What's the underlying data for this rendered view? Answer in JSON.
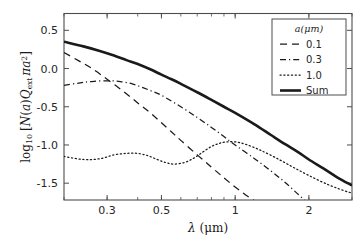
{
  "chart_data": {
    "type": "line",
    "title": "",
    "xlabel": "λ (μm)",
    "ylabel": "log₁₀ [N(a)Q_ext πa²]",
    "xscale": "log",
    "yscale": "linear",
    "xlim": [
      0.2,
      3.0
    ],
    "ylim": [
      -1.72,
      0.72
    ],
    "xticks": [
      0.3,
      0.5,
      1,
      2
    ],
    "xtick_labels": [
      "0.3",
      "0.5",
      "1",
      "2"
    ],
    "yticks": [
      0.5,
      0.0,
      -0.5,
      -1.0,
      -1.5
    ],
    "ytick_labels": [
      "0.5",
      "0.0",
      "-0.5",
      "-1.0",
      "-1.5"
    ],
    "grid": false,
    "legend_position": "upper right",
    "legend_title": "a(μm)",
    "series": [
      {
        "name": "0.1",
        "label": "0.1",
        "style": "dashed",
        "color": "#1a1a1a",
        "x": [
          0.2,
          0.23,
          0.26,
          0.3,
          0.35,
          0.4,
          0.45,
          0.5,
          0.55,
          0.6,
          0.7,
          0.8,
          0.9,
          1.0,
          1.1,
          1.2,
          1.25
        ],
        "y": [
          0.21,
          0.1,
          0.0,
          -0.14,
          -0.3,
          -0.45,
          -0.58,
          -0.71,
          -0.83,
          -0.94,
          -1.13,
          -1.29,
          -1.43,
          -1.55,
          -1.65,
          -1.73,
          -1.78
        ]
      },
      {
        "name": "0.3",
        "label": "0.3",
        "style": "dashdot",
        "color": "#1a1a1a",
        "x": [
          0.2,
          0.23,
          0.26,
          0.3,
          0.34,
          0.38,
          0.42,
          0.46,
          0.5,
          0.6,
          0.7,
          0.8,
          0.9,
          1.0,
          1.2,
          1.4,
          1.6,
          1.8,
          1.95
        ],
        "y": [
          -0.22,
          -0.19,
          -0.17,
          -0.16,
          -0.17,
          -0.2,
          -0.25,
          -0.3,
          -0.35,
          -0.5,
          -0.64,
          -0.77,
          -0.89,
          -1.0,
          -1.18,
          -1.34,
          -1.49,
          -1.64,
          -1.74
        ]
      },
      {
        "name": "1.0",
        "label": "1.0",
        "style": "dotted",
        "color": "#1a1a1a",
        "x": [
          0.2,
          0.24,
          0.28,
          0.32,
          0.36,
          0.4,
          0.44,
          0.48,
          0.52,
          0.56,
          0.62,
          0.68,
          0.74,
          0.8,
          0.86,
          0.92,
          1.0,
          1.1,
          1.25,
          1.45,
          1.7,
          2.0,
          2.4,
          2.8,
          3.0
        ],
        "y": [
          -1.15,
          -1.19,
          -1.18,
          -1.13,
          -1.11,
          -1.11,
          -1.14,
          -1.19,
          -1.23,
          -1.25,
          -1.23,
          -1.17,
          -1.09,
          -1.02,
          -0.98,
          -0.96,
          -0.96,
          -0.99,
          -1.06,
          -1.16,
          -1.28,
          -1.4,
          -1.52,
          -1.6,
          -1.63
        ]
      },
      {
        "name": "Sum",
        "label": "Sum",
        "style": "solid",
        "color": "#1a1a1a",
        "x": [
          0.2,
          0.24,
          0.28,
          0.32,
          0.36,
          0.4,
          0.45,
          0.5,
          0.55,
          0.6,
          0.7,
          0.8,
          0.9,
          1.0,
          1.2,
          1.4,
          1.6,
          1.8,
          2.0,
          2.3,
          2.6,
          3.0
        ],
        "y": [
          0.35,
          0.29,
          0.23,
          0.17,
          0.11,
          0.06,
          -0.01,
          -0.08,
          -0.14,
          -0.2,
          -0.31,
          -0.41,
          -0.5,
          -0.58,
          -0.73,
          -0.87,
          -0.99,
          -1.09,
          -1.19,
          -1.31,
          -1.42,
          -1.53
        ]
      }
    ]
  },
  "axes": {
    "ylabel_parts": {
      "log": "log",
      "sub10": "10",
      "bracket_open": "[",
      "n": "N",
      "paren_open": "(",
      "a1": "a",
      "paren_close": ")",
      "q": "Q",
      "ext": "ext",
      "pi": "πa",
      "sup2": "2",
      "bracket_close": "]"
    },
    "xlabel_parts": {
      "lambda": "λ",
      "unit": "(μm)"
    }
  }
}
